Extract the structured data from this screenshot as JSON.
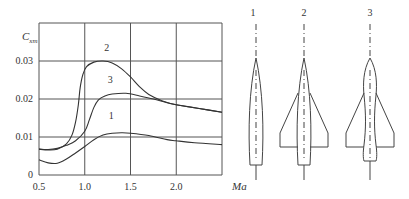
{
  "chart_data": {
    "type": "line",
    "title": "",
    "xlabel": "Ma",
    "ylabel": "C_xm",
    "ylabel_main": "C",
    "ylabel_sub": "xm",
    "xlim": [
      0.5,
      2.5
    ],
    "ylim": [
      0,
      0.04
    ],
    "grid": true,
    "x_ticks": [
      "0.5",
      "1.0",
      "1.5",
      "2.0"
    ],
    "y_ticks": [
      "0",
      "0.01",
      "0.02",
      "0.03"
    ],
    "series": [
      {
        "name": "1",
        "points": [
          [
            0.5,
            0.004
          ],
          [
            0.6,
            0.0032
          ],
          [
            0.7,
            0.0031
          ],
          [
            0.8,
            0.0042
          ],
          [
            0.9,
            0.0058
          ],
          [
            1.0,
            0.0075
          ],
          [
            1.1,
            0.0093
          ],
          [
            1.2,
            0.0105
          ],
          [
            1.3,
            0.011
          ],
          [
            1.4,
            0.0111
          ],
          [
            1.5,
            0.011
          ],
          [
            1.7,
            0.0104
          ],
          [
            1.9,
            0.0093
          ],
          [
            2.0,
            0.009
          ],
          [
            2.2,
            0.0085
          ],
          [
            2.5,
            0.008
          ]
        ]
      },
      {
        "name": "2",
        "points": [
          [
            0.5,
            0.0068
          ],
          [
            0.6,
            0.0066
          ],
          [
            0.7,
            0.0068
          ],
          [
            0.8,
            0.0082
          ],
          [
            0.86,
            0.0105
          ],
          [
            0.9,
            0.014
          ],
          [
            0.93,
            0.0185
          ],
          [
            0.95,
            0.023
          ],
          [
            0.98,
            0.0265
          ],
          [
            1.02,
            0.0285
          ],
          [
            1.1,
            0.0297
          ],
          [
            1.2,
            0.03
          ],
          [
            1.3,
            0.0295
          ],
          [
            1.4,
            0.028
          ],
          [
            1.5,
            0.0258
          ],
          [
            1.6,
            0.0232
          ],
          [
            1.7,
            0.0212
          ],
          [
            1.85,
            0.0195
          ],
          [
            2.0,
            0.0185
          ],
          [
            2.25,
            0.0175
          ],
          [
            2.5,
            0.0165
          ]
        ]
      },
      {
        "name": "3",
        "points": [
          [
            0.5,
            0.0068
          ],
          [
            0.6,
            0.0067
          ],
          [
            0.7,
            0.007
          ],
          [
            0.8,
            0.0078
          ],
          [
            0.9,
            0.009
          ],
          [
            1.0,
            0.0115
          ],
          [
            1.05,
            0.0145
          ],
          [
            1.1,
            0.0178
          ],
          [
            1.15,
            0.0198
          ],
          [
            1.22,
            0.0208
          ],
          [
            1.3,
            0.0213
          ],
          [
            1.45,
            0.0215
          ],
          [
            1.6,
            0.0208
          ],
          [
            1.75,
            0.02
          ],
          [
            1.9,
            0.019
          ],
          [
            2.0,
            0.0185
          ],
          [
            2.25,
            0.0175
          ],
          [
            2.5,
            0.0165
          ]
        ]
      }
    ],
    "annotations": [
      {
        "text": "2",
        "x": 1.24,
        "y": 0.0335
      },
      {
        "text": "3",
        "x": 1.28,
        "y": 0.025
      },
      {
        "text": "1",
        "x": 1.29,
        "y": 0.0155
      }
    ]
  },
  "diagram": {
    "labels": [
      "1",
      "2",
      "3"
    ],
    "descriptions": [
      "body alone",
      "body with delta wing",
      "waisted body with delta wing"
    ]
  }
}
